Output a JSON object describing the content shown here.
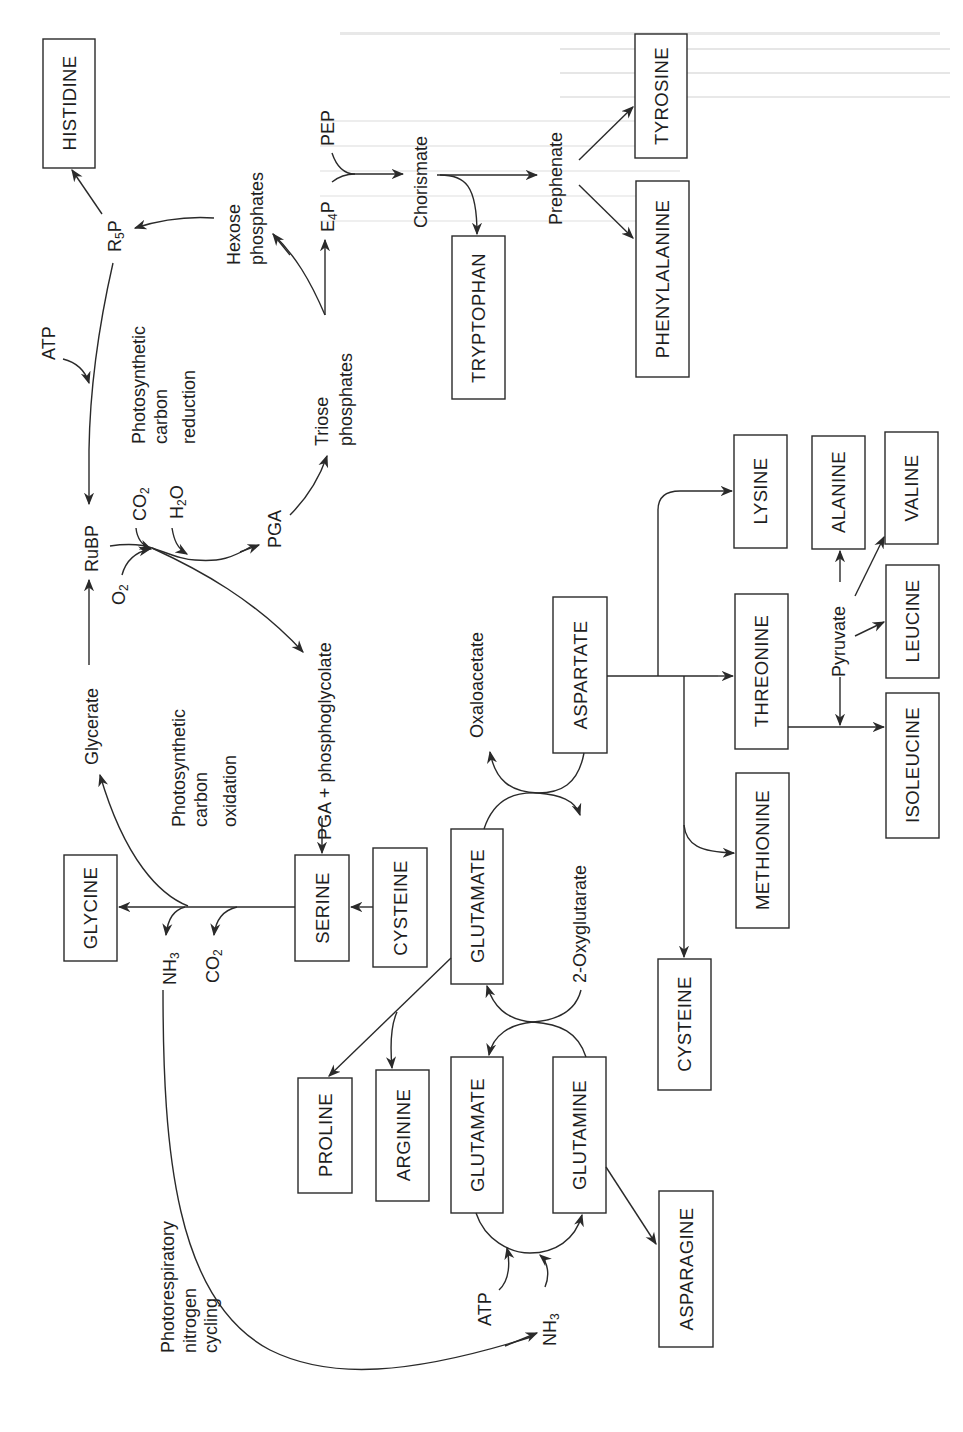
{
  "figure": {
    "orientation": "rotated 90 degrees clockwise (text reads bottom-to-top)"
  },
  "cycles": {
    "carbon_reduction": [
      "Photosynthetic",
      "carbon",
      "reduction"
    ],
    "carbon_oxidation": [
      "Photosynthetic",
      "carbon",
      "oxidation"
    ],
    "nitrogen_cycling": [
      "Photorespiratory",
      "nitrogen",
      "cycling"
    ]
  },
  "amino_acids": {
    "histidine": "HISTIDINE",
    "tyrosine": "TYROSINE",
    "phenylalanine": "PHENYLALANINE",
    "tryptophan": "TRYPTOPHAN",
    "glycine": "GLYCINE",
    "serine": "SERINE",
    "cysteine_1": "CYSTEINE",
    "glutamate_1": "GLUTAMATE",
    "glutamate_2": "GLUTAMATE",
    "glutamine": "GLUTAMINE",
    "proline": "PROLINE",
    "arginine": "ARGININE",
    "asparagine": "ASPARAGINE",
    "aspartate": "ASPARTATE",
    "lysine": "LYSINE",
    "threonine": "THREONINE",
    "methionine": "METHIONINE",
    "cysteine_2": "CYSTEINE",
    "alanine": "ALANINE",
    "valine": "VALINE",
    "leucine": "LEUCINE",
    "isoleucine": "ISOLEUCINE"
  },
  "metabolites": {
    "atp_top": "ATP",
    "r5p_main": "R",
    "r5p_sub": "5",
    "r5p_tail": "P",
    "hexose": [
      "Hexose",
      "phosphates"
    ],
    "pep": "PEP",
    "e4p_main": "E",
    "e4p_sub": "4",
    "e4p_tail": "P",
    "chorismate": "Chorismate",
    "prephenate": "Prephenate",
    "triose": [
      "Triose",
      "phosphates"
    ],
    "rubp": "RuBP",
    "co2_top_main": "CO",
    "co2_top_sub": "2",
    "h2o_main": "H",
    "h2o_sub": "2",
    "h2o_tail": "O",
    "o2_main": "O",
    "o2_sub": "2",
    "pga": "PGA",
    "pga_phosphoglycolate": "PGA + phosphoglycolate",
    "glycerate": "Glycerate",
    "nh3_main": "NH",
    "nh3_sub": "3",
    "co2_low_main": "CO",
    "co2_low_sub": "2",
    "oxaloacetate": "Oxaloacetate",
    "oxyglutarate": "2-Oxyglutarate",
    "pyruvate": "Pyruvate",
    "atp_bottom": "ATP",
    "nh3_bottom_main": "NH",
    "nh3_bottom_sub": "3"
  }
}
